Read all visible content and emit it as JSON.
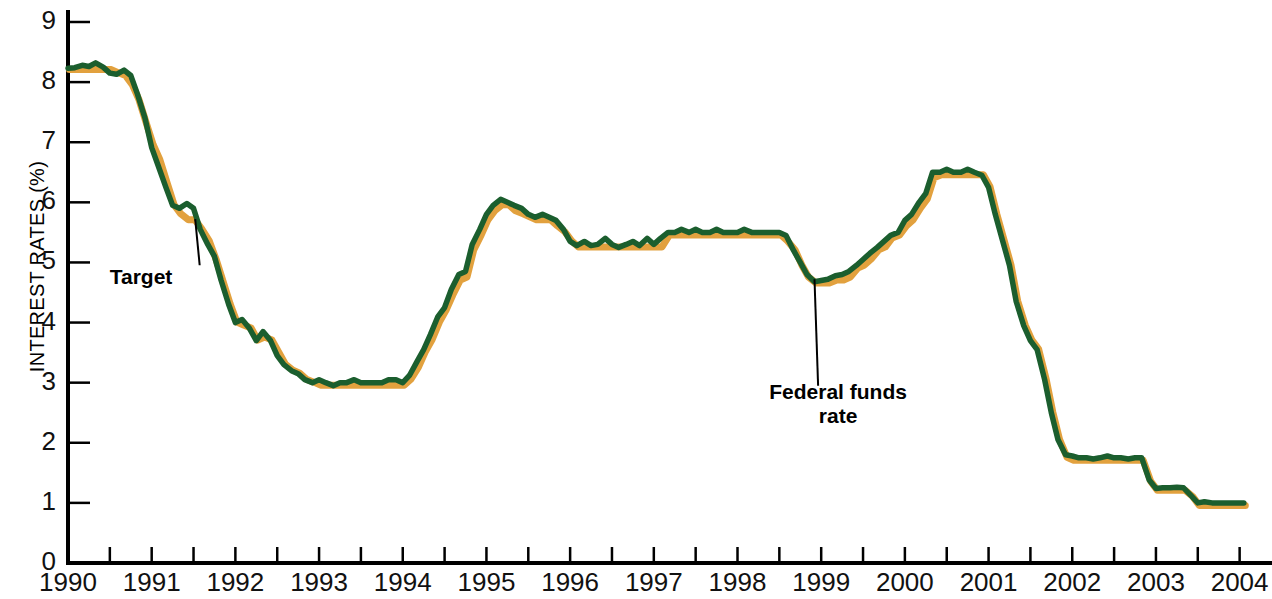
{
  "chart_data": {
    "type": "line",
    "title": "",
    "subtitle": "",
    "xlabel": "",
    "ylabel": "INTEREST RATES (%)",
    "xlim": [
      1990.0,
      2004.1
    ],
    "ylim": [
      0,
      9
    ],
    "grid": false,
    "legend_position": "inline-annotations",
    "ytick_labels": [
      "0",
      "1",
      "2",
      "3",
      "4",
      "5",
      "6",
      "7",
      "8",
      "9"
    ],
    "ytick_values": [
      0,
      1,
      2,
      3,
      4,
      5,
      6,
      7,
      8,
      9
    ],
    "xtick_labels": [
      "1990",
      "1991",
      "1992",
      "1993",
      "1994",
      "1995",
      "1996",
      "1997",
      "1998",
      "1999",
      "2000",
      "2001",
      "2002",
      "2003",
      "2004"
    ],
    "xtick_values": [
      1990,
      1991,
      1992,
      1993,
      1994,
      1995,
      1996,
      1997,
      1998,
      1999,
      2000,
      2001,
      2002,
      2003,
      2004
    ],
    "minor_xtick_values": [
      1990.5,
      1991.5,
      1992.5,
      1993.5,
      1994.5,
      1995.5,
      1996.5,
      1997.5,
      1998.5,
      1999.5,
      2000.5,
      2001.5,
      2002.5,
      2003.5
    ],
    "annotations": [
      {
        "name": "Target",
        "text": "Target",
        "label_x": 1991.0,
        "label_y": 4.72,
        "point_x": 1991.52,
        "point_y": 5.72
      },
      {
        "name": "Federal funds rate",
        "text_line1": "Federal funds",
        "text_line2": "rate",
        "label_x": 1999.25,
        "label_y": 3.28,
        "point_x": 1998.92,
        "point_y": 4.72
      }
    ],
    "series": [
      {
        "name": "Target",
        "color": "#E2A13E",
        "x": [
          1990.0,
          1990.08,
          1990.17,
          1990.25,
          1990.33,
          1990.42,
          1990.5,
          1990.58,
          1990.67,
          1990.75,
          1990.83,
          1990.92,
          1991.0,
          1991.08,
          1991.17,
          1991.25,
          1991.33,
          1991.42,
          1991.5,
          1991.58,
          1991.67,
          1991.75,
          1991.83,
          1991.92,
          1992.0,
          1992.08,
          1992.17,
          1992.25,
          1992.33,
          1992.42,
          1992.5,
          1992.58,
          1992.67,
          1992.75,
          1992.83,
          1992.92,
          1993.0,
          1993.08,
          1993.17,
          1993.25,
          1993.33,
          1993.42,
          1993.5,
          1993.58,
          1993.67,
          1993.75,
          1993.83,
          1993.92,
          1994.0,
          1994.08,
          1994.17,
          1994.25,
          1994.33,
          1994.42,
          1994.5,
          1994.58,
          1994.67,
          1994.75,
          1994.83,
          1994.92,
          1995.0,
          1995.08,
          1995.17,
          1995.25,
          1995.33,
          1995.42,
          1995.5,
          1995.58,
          1995.67,
          1995.75,
          1995.83,
          1995.92,
          1996.0,
          1996.08,
          1996.17,
          1996.25,
          1996.33,
          1996.42,
          1996.5,
          1996.58,
          1996.67,
          1996.75,
          1996.83,
          1996.92,
          1997.0,
          1997.08,
          1997.17,
          1997.25,
          1997.33,
          1997.42,
          1997.5,
          1997.58,
          1997.67,
          1997.75,
          1997.83,
          1997.92,
          1998.0,
          1998.08,
          1998.17,
          1998.25,
          1998.33,
          1998.42,
          1998.5,
          1998.58,
          1998.67,
          1998.75,
          1998.83,
          1998.92,
          1999.0,
          1999.08,
          1999.17,
          1999.25,
          1999.33,
          1999.42,
          1999.5,
          1999.58,
          1999.67,
          1999.75,
          1999.83,
          1999.92,
          2000.0,
          2000.08,
          2000.17,
          2000.25,
          2000.33,
          2000.42,
          2000.5,
          2000.58,
          2000.67,
          2000.75,
          2000.83,
          2000.92,
          2001.0,
          2001.08,
          2001.17,
          2001.25,
          2001.33,
          2001.42,
          2001.5,
          2001.58,
          2001.67,
          2001.75,
          2001.83,
          2001.92,
          2002.0,
          2002.08,
          2002.17,
          2002.25,
          2002.33,
          2002.42,
          2002.5,
          2002.58,
          2002.67,
          2002.75,
          2002.83,
          2002.92,
          2003.0,
          2003.08,
          2003.17,
          2003.25,
          2003.33,
          2003.42,
          2003.5,
          2003.58,
          2003.67,
          2003.75,
          2003.83,
          2003.92,
          2004.0,
          2004.05
        ],
        "y": [
          8.25,
          8.25,
          8.25,
          8.25,
          8.25,
          8.25,
          8.25,
          8.2,
          8.15,
          8.0,
          7.75,
          7.35,
          7.0,
          6.75,
          6.35,
          6.0,
          5.85,
          5.75,
          5.75,
          5.6,
          5.4,
          5.1,
          4.75,
          4.35,
          4.05,
          4.0,
          3.95,
          3.75,
          3.8,
          3.75,
          3.55,
          3.35,
          3.25,
          3.2,
          3.1,
          3.05,
          3.0,
          3.0,
          3.0,
          3.0,
          3.0,
          3.0,
          3.0,
          3.0,
          3.0,
          3.0,
          3.0,
          3.0,
          3.0,
          3.1,
          3.3,
          3.55,
          3.75,
          4.05,
          4.25,
          4.5,
          4.75,
          4.8,
          5.25,
          5.5,
          5.75,
          5.9,
          6.0,
          6.0,
          5.9,
          5.85,
          5.8,
          5.75,
          5.75,
          5.75,
          5.65,
          5.55,
          5.4,
          5.3,
          5.3,
          5.3,
          5.3,
          5.3,
          5.3,
          5.3,
          5.3,
          5.3,
          5.3,
          5.3,
          5.3,
          5.3,
          5.5,
          5.5,
          5.5,
          5.5,
          5.5,
          5.5,
          5.5,
          5.5,
          5.5,
          5.5,
          5.5,
          5.5,
          5.5,
          5.5,
          5.5,
          5.5,
          5.5,
          5.4,
          5.25,
          5.0,
          4.8,
          4.7,
          4.7,
          4.7,
          4.75,
          4.75,
          4.8,
          4.95,
          5.0,
          5.1,
          5.25,
          5.3,
          5.45,
          5.5,
          5.65,
          5.75,
          5.95,
          6.1,
          6.45,
          6.5,
          6.5,
          6.5,
          6.5,
          6.5,
          6.5,
          6.5,
          6.3,
          5.85,
          5.4,
          5.0,
          4.4,
          4.0,
          3.75,
          3.6,
          3.1,
          2.55,
          2.1,
          1.8,
          1.75,
          1.75,
          1.75,
          1.75,
          1.75,
          1.75,
          1.75,
          1.75,
          1.75,
          1.75,
          1.75,
          1.4,
          1.25,
          1.25,
          1.25,
          1.25,
          1.25,
          1.15,
          1.0,
          1.0,
          1.0,
          1.0,
          1.0,
          1.0,
          1.0,
          1.0
        ]
      },
      {
        "name": "Federal funds rate",
        "color": "#1B5E2E",
        "x": [
          1990.0,
          1990.08,
          1990.17,
          1990.25,
          1990.33,
          1990.42,
          1990.5,
          1990.58,
          1990.67,
          1990.75,
          1990.83,
          1990.92,
          1991.0,
          1991.08,
          1991.17,
          1991.25,
          1991.33,
          1991.42,
          1991.5,
          1991.58,
          1991.67,
          1991.75,
          1991.83,
          1991.92,
          1992.0,
          1992.08,
          1992.17,
          1992.25,
          1992.33,
          1992.42,
          1992.5,
          1992.58,
          1992.67,
          1992.75,
          1992.83,
          1992.92,
          1993.0,
          1993.08,
          1993.17,
          1993.25,
          1993.33,
          1993.42,
          1993.5,
          1993.58,
          1993.67,
          1993.75,
          1993.83,
          1993.92,
          1994.0,
          1994.08,
          1994.17,
          1994.25,
          1994.33,
          1994.42,
          1994.5,
          1994.58,
          1994.67,
          1994.75,
          1994.83,
          1994.92,
          1995.0,
          1995.08,
          1995.17,
          1995.25,
          1995.33,
          1995.42,
          1995.5,
          1995.58,
          1995.67,
          1995.75,
          1995.83,
          1995.92,
          1996.0,
          1996.08,
          1996.17,
          1996.25,
          1996.33,
          1996.42,
          1996.5,
          1996.58,
          1996.67,
          1996.75,
          1996.83,
          1996.92,
          1997.0,
          1997.08,
          1997.17,
          1997.25,
          1997.33,
          1997.42,
          1997.5,
          1997.58,
          1997.67,
          1997.75,
          1997.83,
          1997.92,
          1998.0,
          1998.08,
          1998.17,
          1998.25,
          1998.33,
          1998.42,
          1998.5,
          1998.58,
          1998.67,
          1998.75,
          1998.83,
          1998.92,
          1999.0,
          1999.08,
          1999.17,
          1999.25,
          1999.33,
          1999.42,
          1999.5,
          1999.58,
          1999.67,
          1999.75,
          1999.83,
          1999.92,
          2000.0,
          2000.08,
          2000.17,
          2000.25,
          2000.33,
          2000.42,
          2000.5,
          2000.58,
          2000.67,
          2000.75,
          2000.83,
          2000.92,
          2001.0,
          2001.08,
          2001.17,
          2001.25,
          2001.33,
          2001.42,
          2001.5,
          2001.58,
          2001.67,
          2001.75,
          2001.83,
          2001.92,
          2002.0,
          2002.08,
          2002.17,
          2002.25,
          2002.33,
          2002.42,
          2002.5,
          2002.58,
          2002.67,
          2002.75,
          2002.83,
          2002.92,
          2003.0,
          2003.08,
          2003.17,
          2003.25,
          2003.33,
          2003.42,
          2003.5,
          2003.58,
          2003.67,
          2003.75,
          2003.83,
          2003.92,
          2004.0,
          2004.05
        ],
        "y": [
          8.23,
          8.24,
          8.28,
          8.26,
          8.32,
          8.25,
          8.15,
          8.13,
          8.2,
          8.11,
          7.8,
          7.4,
          6.91,
          6.6,
          6.25,
          5.95,
          5.9,
          5.98,
          5.9,
          5.55,
          5.3,
          5.1,
          4.7,
          4.3,
          4.0,
          4.05,
          3.9,
          3.7,
          3.85,
          3.7,
          3.45,
          3.3,
          3.2,
          3.15,
          3.05,
          3.0,
          3.05,
          3.0,
          2.95,
          3.0,
          3.0,
          3.05,
          3.0,
          3.0,
          3.0,
          3.0,
          3.05,
          3.05,
          3.0,
          3.12,
          3.35,
          3.55,
          3.8,
          4.1,
          4.25,
          4.55,
          4.8,
          4.85,
          5.3,
          5.55,
          5.8,
          5.95,
          6.05,
          6.0,
          5.95,
          5.9,
          5.8,
          5.75,
          5.8,
          5.75,
          5.7,
          5.55,
          5.35,
          5.28,
          5.35,
          5.28,
          5.3,
          5.4,
          5.3,
          5.25,
          5.3,
          5.35,
          5.28,
          5.4,
          5.3,
          5.4,
          5.5,
          5.5,
          5.55,
          5.5,
          5.55,
          5.5,
          5.5,
          5.55,
          5.5,
          5.5,
          5.5,
          5.55,
          5.5,
          5.5,
          5.5,
          5.5,
          5.5,
          5.45,
          5.2,
          5.0,
          4.8,
          4.68,
          4.7,
          4.72,
          4.78,
          4.8,
          4.85,
          4.95,
          5.05,
          5.15,
          5.25,
          5.35,
          5.45,
          5.5,
          5.7,
          5.8,
          6.0,
          6.15,
          6.5,
          6.5,
          6.55,
          6.5,
          6.5,
          6.55,
          6.5,
          6.45,
          6.25,
          5.8,
          5.35,
          4.95,
          4.35,
          3.95,
          3.7,
          3.55,
          3.05,
          2.5,
          2.05,
          1.8,
          1.78,
          1.75,
          1.75,
          1.73,
          1.75,
          1.78,
          1.75,
          1.75,
          1.73,
          1.75,
          1.75,
          1.38,
          1.24,
          1.25,
          1.25,
          1.26,
          1.25,
          1.12,
          1.0,
          1.02,
          1.0,
          1.0,
          1.0,
          1.0,
          1.0,
          1.0
        ]
      }
    ]
  }
}
